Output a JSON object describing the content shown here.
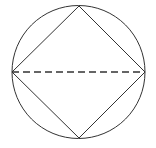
{
  "diagram": {
    "stroke_color": "#333333",
    "circle": {
      "cx": 78.5,
      "cy": 72,
      "r": 66.5
    },
    "square_vertices": {
      "top": [
        79,
        6
      ],
      "right": [
        145,
        72
      ],
      "bottom": [
        79,
        138
      ],
      "left": [
        12,
        72
      ]
    },
    "diagonal": {
      "from": "left",
      "to": "right",
      "style": "dashed",
      "dash": "7 4"
    }
  }
}
